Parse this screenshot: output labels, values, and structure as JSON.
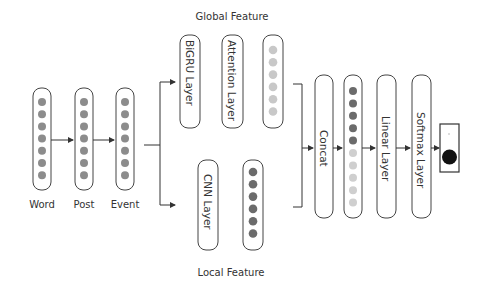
{
  "labels": {
    "global_feature": "Global Feature",
    "local_feature": "Local Feature",
    "word": "Word",
    "post": "Post",
    "event": "Event"
  },
  "layers": {
    "bigru": "BiGRU Layer",
    "attention": "Attention Layer",
    "cnn": "CNN Layer",
    "concat": "Concat",
    "linear": "Linear Layer",
    "softmax": "Softmax Layer"
  },
  "vectors": {
    "word_nodes": 7,
    "post_nodes": 7,
    "event_nodes": 7,
    "global_nodes": 6,
    "local_nodes": 6,
    "merged_dark_nodes": 5,
    "merged_light_nodes": 5
  },
  "colors": {
    "input_node": "#8c8c8c",
    "global_node": "#c8c8c8",
    "local_node": "#6b6b6b",
    "merged_dark": "#6b6b6b",
    "merged_light": "#cfcfcf",
    "output_node": "#111111",
    "stroke": "#444444"
  }
}
